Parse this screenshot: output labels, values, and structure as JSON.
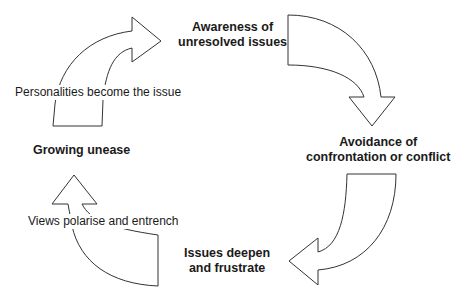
{
  "diagram": {
    "type": "cycle",
    "stages": [
      {
        "id": "awareness",
        "lines": [
          "Awareness of",
          "unresolved issues"
        ]
      },
      {
        "id": "avoidance",
        "lines": [
          "Avoidance of",
          "confrontation or conflict"
        ]
      },
      {
        "id": "deepen",
        "lines": [
          "Issues deepen",
          "and frustrate"
        ]
      },
      {
        "id": "unease",
        "lines": [
          "Growing unease"
        ]
      }
    ],
    "transitions": [
      {
        "from": "unease",
        "to": "awareness",
        "label": "Personalities become the issue"
      },
      {
        "from": "deepen",
        "to": "unease",
        "label": "Views polarise and entrench"
      }
    ],
    "colors": {
      "stroke": "#333333",
      "fill": "#ffffff",
      "text": "#1a1a1a"
    }
  }
}
